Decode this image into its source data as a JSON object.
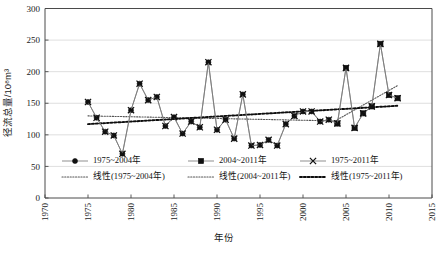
{
  "chart_data": {
    "type": "line",
    "title": "",
    "xlabel": "年份",
    "ylabel": "径流总量/10⁸m³",
    "xlim": [
      1970,
      2015
    ],
    "ylim": [
      0,
      300
    ],
    "xticks": [
      "1970",
      "1975",
      "1980",
      "1985",
      "1990",
      "1995",
      "2000",
      "2005",
      "2010",
      "2015"
    ],
    "yticks": [
      "0",
      "50",
      "100",
      "150",
      "200",
      "250",
      "300"
    ],
    "grid": "horizontal",
    "legend_position": "inside-bottom-left",
    "x": [
      1975,
      1976,
      1977,
      1978,
      1979,
      1980,
      1981,
      1982,
      1983,
      1984,
      1985,
      1986,
      1987,
      1988,
      1989,
      1990,
      1991,
      1992,
      1993,
      1994,
      1995,
      1996,
      1997,
      1998,
      1999,
      2000,
      2001,
      2002,
      2003,
      2004,
      2005,
      2006,
      2007,
      2008,
      2009,
      2010,
      2011
    ],
    "series": [
      {
        "name": "1975~2004年",
        "marker": "filled-circle",
        "values": [
          152,
          127,
          105,
          99,
          70,
          139,
          181,
          155,
          160,
          114,
          128,
          102,
          121,
          112,
          215,
          108,
          124,
          94,
          164,
          83,
          84,
          92,
          83,
          117,
          130,
          137,
          137,
          121,
          124,
          118,
          null,
          null,
          null,
          null,
          null,
          null,
          null
        ]
      },
      {
        "name": "2004~2011年",
        "marker": "filled-square",
        "values": [
          null,
          null,
          null,
          null,
          null,
          null,
          null,
          null,
          null,
          null,
          null,
          null,
          null,
          null,
          null,
          null,
          null,
          null,
          null,
          null,
          null,
          null,
          null,
          null,
          null,
          null,
          null,
          null,
          null,
          118,
          206,
          111,
          134,
          145,
          244,
          163,
          158
        ]
      },
      {
        "name": "1975~2011年",
        "marker": "cross",
        "values": [
          152,
          127,
          105,
          99,
          70,
          139,
          181,
          155,
          160,
          114,
          128,
          102,
          121,
          112,
          215,
          108,
          124,
          94,
          164,
          83,
          84,
          92,
          83,
          117,
          130,
          137,
          137,
          121,
          124,
          118,
          206,
          111,
          134,
          145,
          244,
          163,
          158
        ]
      }
    ],
    "trendlines": [
      {
        "name": "线性(1975~2004年)",
        "style": "dotted-thin",
        "x_start": 1975,
        "x_end": 2004,
        "y_start": 130,
        "y_end": 122
      },
      {
        "name": "线性(2004~2011年)",
        "style": "dotted-thin",
        "x_start": 2004,
        "x_end": 2011,
        "y_start": 124,
        "y_end": 178
      },
      {
        "name": "线性(1975~2011年)",
        "style": "dotted-bold",
        "x_start": 1975,
        "x_end": 2011,
        "y_start": 117,
        "y_end": 146
      }
    ],
    "legend": [
      {
        "label": "1975~2004年",
        "marker": "filled-circle",
        "kind": "series"
      },
      {
        "label": "2004~2011年",
        "marker": "filled-square",
        "kind": "series"
      },
      {
        "label": "1975~2011年",
        "marker": "cross",
        "kind": "series"
      },
      {
        "label": "线性(1975~2004年)",
        "marker": "dotted-thin",
        "kind": "trend"
      },
      {
        "label": "线性(2004~2011年)",
        "marker": "dotted-thin",
        "kind": "trend"
      },
      {
        "label": "线性(1975~2011年)",
        "marker": "dotted-bold",
        "kind": "trend"
      }
    ],
    "colors": {
      "series_line": "#7b7b7b",
      "marker": "#101010",
      "grid": "#d7d7d7",
      "axis": "#4a4a4a",
      "trend_bold": "#0d0d0d"
    }
  }
}
